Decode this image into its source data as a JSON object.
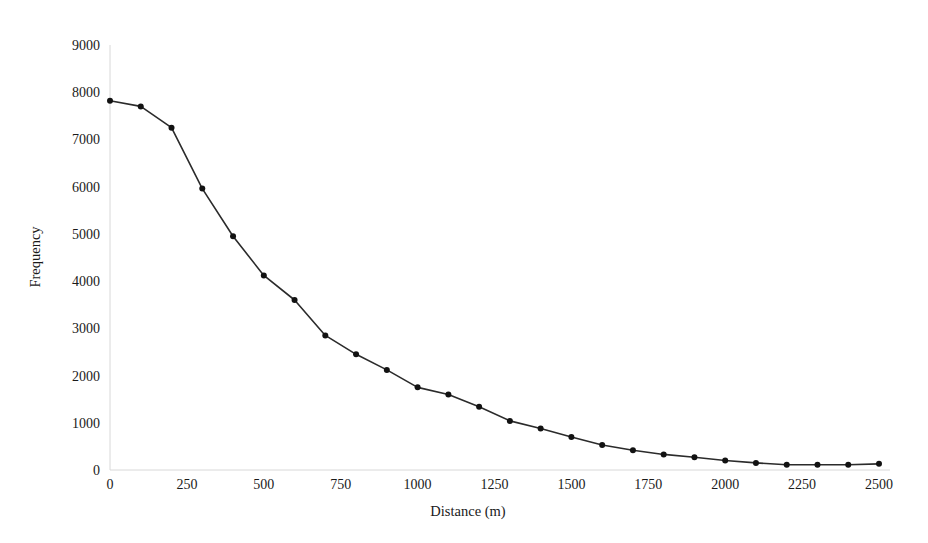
{
  "chart_data": {
    "type": "line",
    "title": "",
    "xlabel": "Distance (m)",
    "ylabel": "Frequency",
    "xlim": [
      0,
      2500
    ],
    "ylim": [
      0,
      9000
    ],
    "grid": false,
    "legend": null,
    "marker": "filled-circle",
    "line_color": "#2b2b2b",
    "marker_color": "#121212",
    "x_ticks": [
      0,
      250,
      500,
      750,
      1000,
      1250,
      1500,
      1750,
      2000,
      2250,
      2500
    ],
    "x_tick_labels": [
      "0",
      "250",
      "500",
      "750",
      "1000",
      "1250",
      "1500",
      "1750",
      "2000",
      "2250",
      "2500"
    ],
    "y_ticks": [
      0,
      1000,
      2000,
      3000,
      4000,
      5000,
      6000,
      7000,
      8000,
      9000
    ],
    "y_tick_labels": [
      "0",
      "1000",
      "2000",
      "3000",
      "4000",
      "5000",
      "6000",
      "7000",
      "8000",
      "9000"
    ],
    "x": [
      0,
      100,
      200,
      300,
      400,
      500,
      600,
      700,
      800,
      900,
      1000,
      1100,
      1200,
      1300,
      1400,
      1500,
      1600,
      1700,
      1800,
      1900,
      2000,
      2100,
      2200,
      2300,
      2400,
      2500
    ],
    "values": [
      7820,
      7700,
      7250,
      5960,
      4950,
      4120,
      3600,
      2850,
      2450,
      2120,
      1750,
      1600,
      1340,
      1040,
      880,
      700,
      530,
      420,
      330,
      270,
      200,
      150,
      110,
      110,
      110,
      130
    ],
    "series": [
      {
        "name": "Frequency",
        "x": [
          0,
          100,
          200,
          300,
          400,
          500,
          600,
          700,
          800,
          900,
          1000,
          1100,
          1200,
          1300,
          1400,
          1500,
          1600,
          1700,
          1800,
          1900,
          2000,
          2100,
          2200,
          2300,
          2400,
          2500
        ],
        "values": [
          7820,
          7700,
          7250,
          5960,
          4950,
          4120,
          3600,
          2850,
          2450,
          2120,
          1750,
          1600,
          1340,
          1040,
          880,
          700,
          530,
          420,
          330,
          270,
          200,
          150,
          110,
          110,
          110,
          130
        ]
      }
    ]
  },
  "axes": {
    "x_title": "Distance (m)",
    "y_title": "Frequency"
  }
}
